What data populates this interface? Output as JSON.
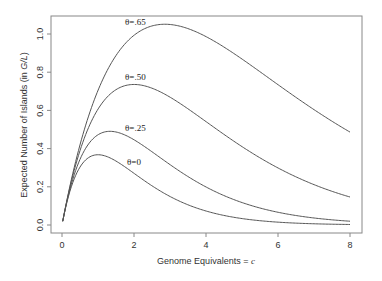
{
  "chart_data": {
    "type": "line",
    "title": "",
    "xlabel": "Genome Equivalents = c",
    "xlabel_main": "Genome Equivalents = ",
    "xlabel_var": "c",
    "ylabel": "Expected Number of Islands (in G/L)",
    "ylabel_main": "Expected Number of Islands (in ",
    "ylabel_var": "G/L",
    "ylabel_close": ")",
    "xlim": [
      0,
      8
    ],
    "ylim": [
      0,
      1.0
    ],
    "xticks": [
      0,
      2,
      4,
      6,
      8
    ],
    "xtick_labels": [
      "0",
      "2",
      "4",
      "6",
      "8"
    ],
    "yticks": [
      0.0,
      0.2,
      0.4,
      0.6,
      0.8,
      1.0
    ],
    "ytick_labels": [
      "0.0",
      "0.2",
      "0.4",
      "0.6",
      "0.8",
      "1.0"
    ],
    "grid": false,
    "legend": "none (inline curve labels)",
    "formula": "N = c * exp(-c * (1 - theta))",
    "series": [
      {
        "name": "θ=.65",
        "theta": 0.65,
        "label_x": 125,
        "label_y": 25,
        "x": [
          0,
          0.5,
          1,
          1.5,
          2,
          2.5,
          2.857,
          3,
          3.5,
          4,
          4.5,
          5,
          5.5,
          6,
          6.5,
          7,
          7.5,
          8
        ],
        "values": [
          0,
          0.42,
          0.705,
          0.889,
          0.993,
          1.042,
          1.051,
          1.05,
          1.029,
          0.986,
          0.93,
          0.869,
          0.802,
          0.735,
          0.671,
          0.605,
          0.544,
          0.486
        ]
      },
      {
        "name": "θ=.50",
        "theta": 0.5,
        "label_x": 125,
        "label_y": 80,
        "x": [
          0,
          0.5,
          1,
          1.5,
          2,
          2.5,
          3,
          3.5,
          4,
          4.5,
          5,
          5.5,
          6,
          6.5,
          7,
          7.5,
          8
        ],
        "values": [
          0,
          0.389,
          0.607,
          0.709,
          0.736,
          0.716,
          0.669,
          0.608,
          0.541,
          0.474,
          0.41,
          0.351,
          0.299,
          0.252,
          0.211,
          0.176,
          0.147
        ]
      },
      {
        "name": "θ=.25",
        "theta": 0.25,
        "label_x": 125,
        "label_y": 131,
        "x": [
          0,
          0.5,
          1,
          1.333,
          1.5,
          2,
          2.5,
          3,
          3.5,
          4,
          4.5,
          5,
          5.5,
          6,
          6.5,
          7,
          7.5,
          8
        ],
        "values": [
          0,
          0.344,
          0.472,
          0.49,
          0.487,
          0.446,
          0.383,
          0.316,
          0.252,
          0.199,
          0.154,
          0.118,
          0.089,
          0.067,
          0.05,
          0.037,
          0.027,
          0.02
        ]
      },
      {
        "name": "θ=0",
        "theta": 0.0,
        "label_x": 127,
        "label_y": 165,
        "x": [
          0,
          0.5,
          1,
          1.5,
          2,
          2.5,
          3,
          3.5,
          4,
          4.5,
          5,
          5.5,
          6,
          6.5,
          7,
          7.5,
          8
        ],
        "values": [
          0,
          0.303,
          0.368,
          0.335,
          0.271,
          0.205,
          0.149,
          0.106,
          0.073,
          0.05,
          0.034,
          0.022,
          0.015,
          0.01,
          0.006,
          0.004,
          0.003
        ]
      }
    ]
  },
  "layout": {
    "frame": {
      "left": 51,
      "top": 16,
      "right": 362,
      "bottom": 233
    },
    "x_pixel": {
      "x0": 62,
      "x8": 350
    },
    "y_pixel": {
      "y0": 225,
      "y1": 34
    },
    "colors": {
      "frame": "#888888",
      "curve": "#555555",
      "text": "#333333"
    }
  }
}
